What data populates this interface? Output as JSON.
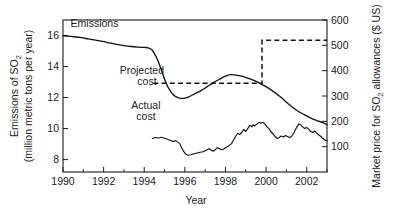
{
  "chart_data": {
    "type": "line",
    "title": "",
    "xlabel": "Year",
    "ylabel_left_line1": "Emissions of SO",
    "ylabel_left_sub": "2",
    "ylabel_left_line2": "(million metric tons per year)",
    "ylabel_right_pre": "Market price for SO",
    "ylabel_right_sub": "2",
    "ylabel_right_post": " allowances ($ US)",
    "xlim": [
      1990,
      2003
    ],
    "ylim_left": [
      7.2,
      17.0
    ],
    "ylim_right": [
      0,
      600
    ],
    "grid": false,
    "legend_position": "inline-annotations",
    "xticks": [
      1990,
      1992,
      1994,
      1996,
      1998,
      2000,
      2002
    ],
    "xticklabels": [
      "1990",
      "1992",
      "1994",
      "1996",
      "1998",
      "2000",
      "2002"
    ],
    "xticks_minor": [
      1991,
      1993,
      1995,
      1997,
      1999,
      2001,
      2003
    ],
    "yticks_left": [
      8,
      10,
      12,
      14,
      16
    ],
    "yticklabels_left": [
      "8",
      "10",
      "12",
      "14",
      "16"
    ],
    "yticks_right": [
      100,
      200,
      300,
      400,
      500,
      600
    ],
    "yticklabels_right": [
      "100",
      "200",
      "300",
      "400",
      "500",
      "600"
    ],
    "annotations": [
      {
        "name": "emissions",
        "text": "Emissions",
        "x": 1991.55,
        "y_left": 16.55
      },
      {
        "name": "projected-cost",
        "text_line1": "Projected",
        "text_line2": "cost",
        "x": 1993.2,
        "y_left": 13.55
      },
      {
        "name": "actual-cost",
        "text_line1": "Actual",
        "text_line2": "cost",
        "x": 1993.1,
        "y_left": 11.25
      }
    ],
    "series": [
      {
        "name": "Emissions",
        "axis": "left",
        "style": "solid",
        "unit": "million metric tons SO2 per year",
        "points": [
          [
            1990.0,
            15.98
          ],
          [
            1990.25,
            15.96
          ],
          [
            1990.55,
            15.92
          ],
          [
            1990.9,
            15.86
          ],
          [
            1991.25,
            15.78
          ],
          [
            1991.6,
            15.7
          ],
          [
            1991.95,
            15.62
          ],
          [
            1992.3,
            15.52
          ],
          [
            1992.65,
            15.43
          ],
          [
            1993.0,
            15.35
          ],
          [
            1993.35,
            15.29
          ],
          [
            1993.7,
            15.25
          ],
          [
            1994.0,
            15.23
          ],
          [
            1994.2,
            15.2
          ],
          [
            1994.4,
            15.05
          ],
          [
            1994.6,
            14.6
          ],
          [
            1994.8,
            13.95
          ],
          [
            1995.0,
            13.2
          ],
          [
            1995.2,
            12.6
          ],
          [
            1995.45,
            12.15
          ],
          [
            1995.7,
            11.98
          ],
          [
            1995.95,
            11.95
          ],
          [
            1996.2,
            12.05
          ],
          [
            1996.5,
            12.25
          ],
          [
            1996.8,
            12.45
          ],
          [
            1997.1,
            12.7
          ],
          [
            1997.4,
            12.95
          ],
          [
            1997.7,
            13.18
          ],
          [
            1998.0,
            13.38
          ],
          [
            1998.25,
            13.48
          ],
          [
            1998.5,
            13.45
          ],
          [
            1998.8,
            13.38
          ],
          [
            1999.1,
            13.25
          ],
          [
            1999.4,
            13.1
          ],
          [
            1999.7,
            12.92
          ],
          [
            2000.0,
            12.7
          ],
          [
            2000.35,
            12.4
          ],
          [
            2000.7,
            12.05
          ],
          [
            2001.0,
            11.7
          ],
          [
            2001.3,
            11.38
          ],
          [
            2001.6,
            11.1
          ],
          [
            2001.9,
            10.88
          ],
          [
            2002.2,
            10.68
          ],
          [
            2002.5,
            10.52
          ],
          [
            2002.8,
            10.38
          ],
          [
            2003.0,
            10.25
          ]
        ]
      },
      {
        "name": "Projected cost",
        "axis": "right",
        "style": "dashed",
        "unit": "$ US per allowance",
        "points": [
          [
            1994.45,
            350
          ],
          [
            1999.8,
            350
          ],
          [
            1999.8,
            520
          ],
          [
            2003.0,
            520
          ]
        ]
      },
      {
        "name": "Actual cost",
        "axis": "right",
        "style": "solid-jagged",
        "unit": "$ US per allowance",
        "points": [
          [
            1994.4,
            132
          ],
          [
            1994.55,
            136
          ],
          [
            1994.7,
            134
          ],
          [
            1994.85,
            137
          ],
          [
            1995.0,
            133
          ],
          [
            1995.15,
            129
          ],
          [
            1995.3,
            124
          ],
          [
            1995.45,
            120
          ],
          [
            1995.55,
            124
          ],
          [
            1995.65,
            118
          ],
          [
            1995.75,
            112
          ],
          [
            1995.85,
            95
          ],
          [
            1995.95,
            80
          ],
          [
            1996.05,
            70
          ],
          [
            1996.15,
            66
          ],
          [
            1996.3,
            68
          ],
          [
            1996.45,
            72
          ],
          [
            1996.6,
            75
          ],
          [
            1996.75,
            78
          ],
          [
            1996.9,
            80
          ],
          [
            1997.0,
            84
          ],
          [
            1997.1,
            88
          ],
          [
            1997.2,
            92
          ],
          [
            1997.3,
            86
          ],
          [
            1997.4,
            82
          ],
          [
            1997.5,
            88
          ],
          [
            1997.6,
            96
          ],
          [
            1997.7,
            93
          ],
          [
            1997.8,
            88
          ],
          [
            1997.9,
            90
          ],
          [
            1998.0,
            96
          ],
          [
            1998.1,
            100
          ],
          [
            1998.2,
            106
          ],
          [
            1998.3,
            112
          ],
          [
            1998.4,
            126
          ],
          [
            1998.5,
            140
          ],
          [
            1998.6,
            152
          ],
          [
            1998.7,
            148
          ],
          [
            1998.8,
            156
          ],
          [
            1998.9,
            168
          ],
          [
            1999.0,
            160
          ],
          [
            1999.1,
            172
          ],
          [
            1999.2,
            185
          ],
          [
            1999.3,
            178
          ],
          [
            1999.35,
            186
          ],
          [
            1999.45,
            182
          ],
          [
            1999.55,
            190
          ],
          [
            1999.65,
            196
          ],
          [
            1999.75,
            192
          ],
          [
            1999.85,
            196
          ],
          [
            1999.95,
            188
          ],
          [
            2000.05,
            178
          ],
          [
            2000.15,
            170
          ],
          [
            2000.25,
            158
          ],
          [
            2000.35,
            150
          ],
          [
            2000.45,
            140
          ],
          [
            2000.55,
            132
          ],
          [
            2000.65,
            136
          ],
          [
            2000.75,
            142
          ],
          [
            2000.85,
            138
          ],
          [
            2000.95,
            144
          ],
          [
            2001.05,
            140
          ],
          [
            2001.15,
            136
          ],
          [
            2001.25,
            140
          ],
          [
            2001.35,
            152
          ],
          [
            2001.45,
            168
          ],
          [
            2001.55,
            182
          ],
          [
            2001.62,
            190
          ],
          [
            2001.7,
            186
          ],
          [
            2001.8,
            178
          ],
          [
            2001.9,
            172
          ],
          [
            2002.0,
            176
          ],
          [
            2002.1,
            168
          ],
          [
            2002.2,
            160
          ],
          [
            2002.3,
            156
          ],
          [
            2002.4,
            162
          ],
          [
            2002.5,
            152
          ],
          [
            2002.6,
            146
          ],
          [
            2002.7,
            140
          ],
          [
            2002.8,
            132
          ],
          [
            2002.9,
            126
          ],
          [
            2003.0,
            124
          ]
        ]
      }
    ]
  }
}
